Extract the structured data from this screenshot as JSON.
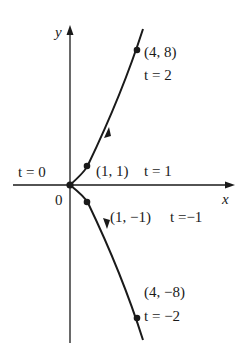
{
  "diagram": {
    "type": "parametric-curve",
    "axes": {
      "x_label": "x",
      "y_label": "y",
      "origin_label": "0"
    },
    "points": [
      {
        "id": "origin",
        "coord": "",
        "param": "t = 0",
        "x": 0,
        "y": 0,
        "t": 0
      },
      {
        "id": "p1",
        "coord": "(1, 1)",
        "param": "t = 1",
        "x": 1,
        "y": 1,
        "t": 1
      },
      {
        "id": "p2",
        "coord": "(4, 8)",
        "param": "t = 2",
        "x": 4,
        "y": 8,
        "t": 2
      },
      {
        "id": "pm1",
        "coord": "(1, −1)",
        "param": "t =−1",
        "x": 1,
        "y": -1,
        "t": -1
      },
      {
        "id": "pm2",
        "coord": "(4, −8)",
        "param": "t = −2",
        "x": 4,
        "y": -8,
        "t": -2
      }
    ],
    "colors": {
      "ink": "#1a1a1a",
      "background": "#ffffff"
    }
  }
}
